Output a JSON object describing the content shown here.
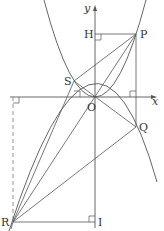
{
  "diagram": {
    "type": "coordinate-geometry",
    "axes": {
      "x_label": "x",
      "y_label": "y",
      "origin_label": "O"
    },
    "points": {
      "P": {
        "label": "P"
      },
      "Q": {
        "label": "Q"
      },
      "R": {
        "label": "R"
      },
      "S": {
        "label": "S"
      },
      "H": {
        "label": "H"
      },
      "I": {
        "label": "I"
      }
    },
    "curves": [
      {
        "name": "upward-parabola",
        "passes_through": [
          "S",
          "O",
          "P"
        ]
      },
      {
        "name": "downward-parabola",
        "passes_through": [
          "R",
          "O",
          "Q"
        ]
      }
    ],
    "segments": [
      [
        "P",
        "S"
      ],
      [
        "S",
        "R"
      ],
      [
        "P",
        "R"
      ],
      [
        "S",
        "Q"
      ],
      [
        "Q",
        "R"
      ],
      [
        "P",
        "Q"
      ],
      [
        "H",
        "P"
      ],
      [
        "R",
        "I"
      ]
    ],
    "colors": {
      "line": "#555555",
      "background": "#ffffff"
    }
  }
}
